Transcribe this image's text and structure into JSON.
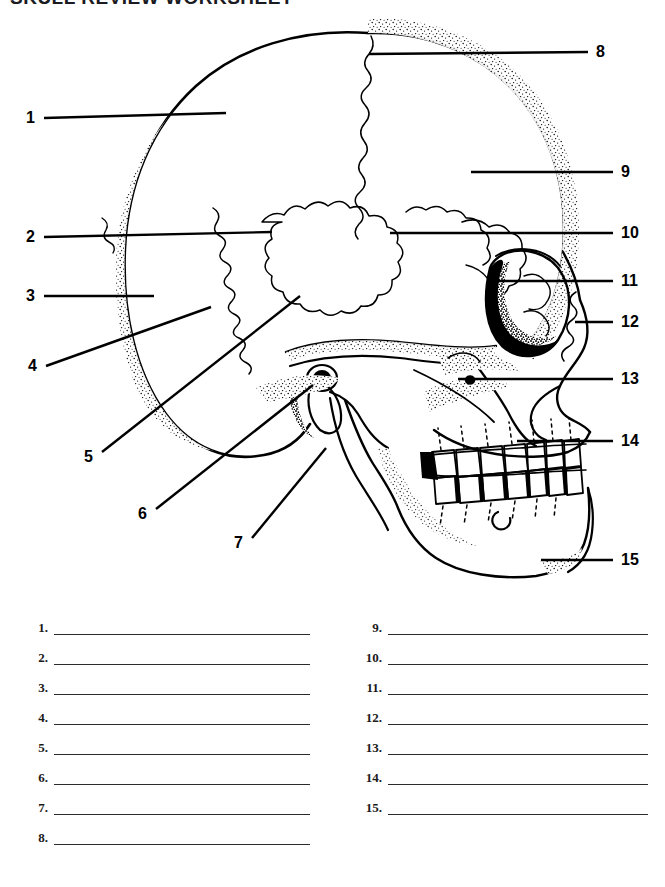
{
  "document": {
    "title": "SKULL REVIEW WORKSHEET",
    "type": "anatomy-labeling-worksheet",
    "figure_caption": "Lateral view of the human skull with 15 numbered leader lines"
  },
  "figure": {
    "name": "skull-lateral-view-diagram",
    "callouts": [
      {
        "number": "1",
        "side": "left",
        "num_x": 26,
        "num_y": 110,
        "line": {
          "x1": 44,
          "y1": 118,
          "x2": 226,
          "y2": 113
        }
      },
      {
        "number": "2",
        "side": "left",
        "num_x": 26,
        "num_y": 229,
        "line": {
          "x1": 44,
          "y1": 237,
          "x2": 272,
          "y2": 232
        }
      },
      {
        "number": "3",
        "side": "left",
        "num_x": 26,
        "num_y": 288,
        "line": {
          "x1": 44,
          "y1": 296,
          "x2": 154,
          "y2": 296
        }
      },
      {
        "number": "4",
        "side": "left",
        "num_x": 28,
        "num_y": 358,
        "line": {
          "x1": 46,
          "y1": 366,
          "x2": 211,
          "y2": 307
        }
      },
      {
        "number": "5",
        "side": "left",
        "num_x": 84,
        "num_y": 449,
        "line": {
          "x1": 102,
          "y1": 452,
          "x2": 300,
          "y2": 296
        }
      },
      {
        "number": "6",
        "side": "left",
        "num_x": 138,
        "num_y": 506,
        "line": {
          "x1": 156,
          "y1": 509,
          "x2": 313,
          "y2": 385
        }
      },
      {
        "number": "7",
        "side": "left",
        "num_x": 234,
        "num_y": 535,
        "line": {
          "x1": 252,
          "y1": 538,
          "x2": 326,
          "y2": 448
        }
      },
      {
        "number": "8",
        "side": "right",
        "num_x": 596,
        "num_y": 44,
        "line": {
          "x1": 588,
          "y1": 52,
          "x2": 369,
          "y2": 54
        }
      },
      {
        "number": "9",
        "side": "right",
        "num_x": 621,
        "num_y": 164,
        "line": {
          "x1": 613,
          "y1": 172,
          "x2": 471,
          "y2": 172
        }
      },
      {
        "number": "10",
        "side": "right",
        "num_x": 621,
        "num_y": 225,
        "line": {
          "x1": 613,
          "y1": 233,
          "x2": 390,
          "y2": 233
        }
      },
      {
        "number": "11",
        "side": "right",
        "num_x": 621,
        "num_y": 273,
        "line": {
          "x1": 613,
          "y1": 281,
          "x2": 487,
          "y2": 281
        }
      },
      {
        "number": "12",
        "side": "right",
        "num_x": 621,
        "num_y": 314,
        "line": {
          "x1": 613,
          "y1": 322,
          "x2": 575,
          "y2": 322
        }
      },
      {
        "number": "13",
        "side": "right",
        "num_x": 621,
        "num_y": 371,
        "line": {
          "x1": 613,
          "y1": 379,
          "x2": 458,
          "y2": 379
        }
      },
      {
        "number": "14",
        "side": "right",
        "num_x": 621,
        "num_y": 433,
        "line": {
          "x1": 613,
          "y1": 441,
          "x2": 517,
          "y2": 441
        }
      },
      {
        "number": "15",
        "side": "right",
        "num_x": 621,
        "num_y": 552,
        "line": {
          "x1": 613,
          "y1": 560,
          "x2": 541,
          "y2": 560
        }
      }
    ]
  },
  "answers": {
    "left_column": [
      {
        "number": "1.",
        "value": ""
      },
      {
        "number": "2.",
        "value": ""
      },
      {
        "number": "3.",
        "value": ""
      },
      {
        "number": "4.",
        "value": ""
      },
      {
        "number": "5.",
        "value": ""
      },
      {
        "number": "6.",
        "value": ""
      },
      {
        "number": "7.",
        "value": ""
      },
      {
        "number": "8.",
        "value": ""
      }
    ],
    "right_column": [
      {
        "number": "9.",
        "value": ""
      },
      {
        "number": "10.",
        "value": ""
      },
      {
        "number": "11.",
        "value": ""
      },
      {
        "number": "12.",
        "value": ""
      },
      {
        "number": "13.",
        "value": ""
      },
      {
        "number": "14.",
        "value": ""
      },
      {
        "number": "15.",
        "value": ""
      }
    ]
  },
  "colors": {
    "ink": "#000000",
    "paper": "#ffffff",
    "rule": "#2b2b2b"
  }
}
